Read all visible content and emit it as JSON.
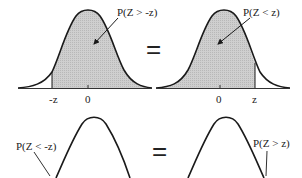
{
  "panels": [
    {
      "id": "top-left",
      "label": "P(Z > -z)",
      "ticks": [
        "-z",
        "0"
      ],
      "shaded": "right-of-minus-z"
    },
    {
      "id": "top-right",
      "label": "P(Z < z)",
      "ticks": [
        "0",
        "z"
      ],
      "shaded": "left-of-z"
    },
    {
      "id": "bottom-left",
      "label": "P(Z < -z)"
    },
    {
      "id": "bottom-right",
      "label": "P(Z > z)"
    }
  ],
  "equals": [
    "=",
    "="
  ],
  "colors": {
    "curve": "#1a1a1a",
    "shade": "#c8c8c8",
    "axis": "#333333"
  }
}
